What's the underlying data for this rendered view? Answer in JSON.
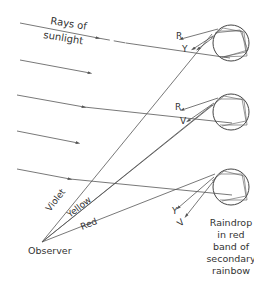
{
  "labels": {
    "sunlight": [
      "Rays of",
      "sunlight"
    ],
    "observer": "Observer",
    "violet": "Violet",
    "yellow": "Yellow",
    "red": "Red",
    "raindrop_caption": [
      "Raindrop",
      "in red",
      "band of",
      "secondary",
      "rainbow"
    ]
  },
  "drops": [
    {
      "name": "top-drop",
      "labels": [
        "R",
        "Y"
      ]
    },
    {
      "name": "middle-drop",
      "labels": [
        "R",
        "V"
      ]
    },
    {
      "name": "bottom-drop",
      "labels": [
        "Y",
        "V"
      ]
    }
  ],
  "colors": {
    "line": "#555555",
    "text": "#333333",
    "background": "#ffffff"
  }
}
